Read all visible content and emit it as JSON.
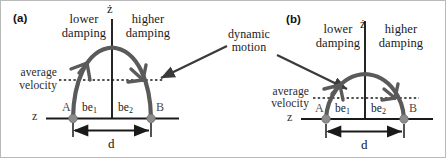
{
  "figure": {
    "colors": {
      "curve": "#5a5a5a",
      "axis": "#1a1a1a",
      "dotted": "#1a1a1a",
      "point": "#8c8c8c",
      "arrow": "#3a3a3a",
      "text": "#1a1a1a"
    }
  },
  "panels": [
    {
      "tag": "(a)",
      "vertical_axis_label": "ż",
      "horizontal_axis_label": "z",
      "left_damping_label_line1": "lower",
      "left_damping_label_line2": "damping",
      "right_damping_label_line1": "higher",
      "right_damping_label_line2": "damping",
      "average_line_label_line1": "average",
      "average_line_label_line2": "velocity",
      "point_left_label": "A",
      "point_right_label": "B",
      "segment_left_label": "be",
      "segment_left_sub": "1",
      "segment_right_label": "be",
      "segment_right_sub": "2",
      "dimension_label": "d"
    },
    {
      "tag": "(b)",
      "vertical_axis_label": "ż",
      "horizontal_axis_label": "z",
      "left_damping_label_line1": "lower",
      "left_damping_label_line2": "damping",
      "right_damping_label_line1": "higher",
      "right_damping_label_line2": "damping",
      "average_line_label_line1": "average",
      "average_line_label_line2": "velocity",
      "point_left_label": "A",
      "point_right_label": "B",
      "segment_left_label": "be",
      "segment_left_sub": "1",
      "segment_right_label": "be",
      "segment_right_sub": "2",
      "dimension_label": "d"
    }
  ],
  "annotation": {
    "label_line1": "dynamic",
    "label_line2": "motion"
  }
}
